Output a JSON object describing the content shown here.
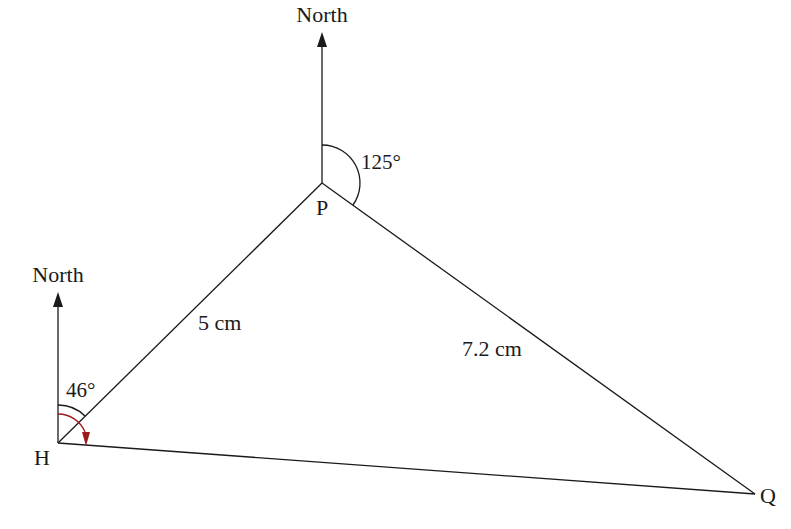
{
  "diagram": {
    "type": "bearings-triangle",
    "points": {
      "H": {
        "label": "H",
        "x": 58,
        "y": 443
      },
      "P": {
        "label": "P",
        "x": 322,
        "y": 183
      },
      "Q": {
        "label": "Q",
        "x": 755,
        "y": 494
      }
    },
    "north_labels": {
      "at_P": "North",
      "at_H": "North"
    },
    "sides": {
      "HP": "5 cm",
      "PQ": "7.2 cm"
    },
    "angles": {
      "at_H": "46°",
      "at_P": "125°"
    },
    "colors": {
      "line": "#1a1a1a",
      "arrow_accent": "#9b1b1b"
    }
  }
}
